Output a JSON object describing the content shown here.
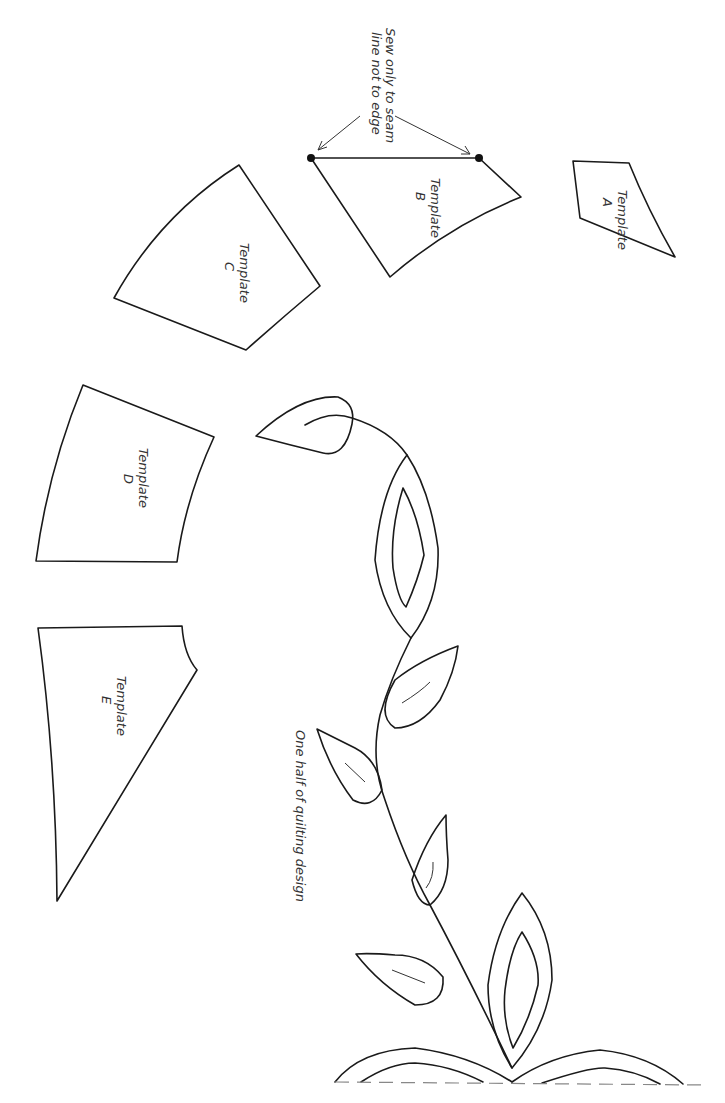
{
  "page": {
    "background": "#ffffff",
    "line_color": "#1a1a1a"
  },
  "templates": [
    {
      "id": "A",
      "line1": "Template",
      "line2": "A"
    },
    {
      "id": "B",
      "line1": "Template",
      "line2": "B"
    },
    {
      "id": "C",
      "line1": "Template",
      "line2": "C"
    },
    {
      "id": "D",
      "line1": "Template",
      "line2": "D"
    },
    {
      "id": "E",
      "line1": "Template",
      "line2": "E"
    }
  ],
  "annotation": {
    "line1": "Sew only to seam",
    "line2": "line not to edge"
  },
  "quilting": {
    "caption": "One half of quilting design"
  }
}
